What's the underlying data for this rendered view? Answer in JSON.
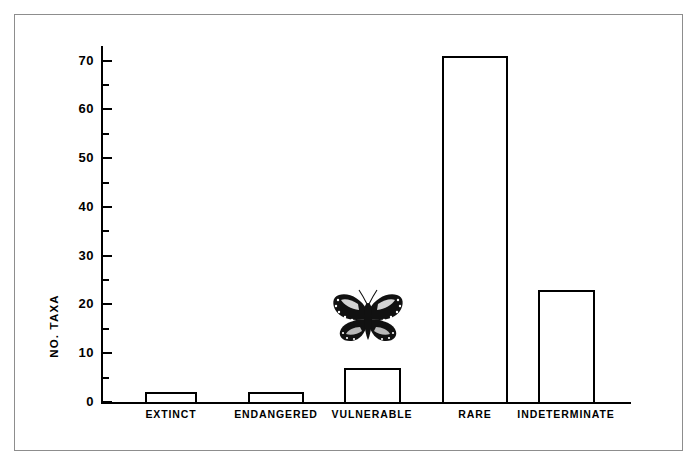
{
  "figure": {
    "border_color": "#8d8d8d",
    "background": "#ffffff",
    "ink_color": "#000000"
  },
  "chart_data": {
    "type": "bar",
    "title": "",
    "xlabel": "",
    "ylabel": "NO. TAXA",
    "categories": [
      "EXTINCT",
      "ENDANGERED",
      "VULNERABLE",
      "RARE",
      "INDETERMINATE"
    ],
    "values": [
      2,
      2,
      7,
      71,
      23
    ],
    "ylim": [
      0,
      73
    ],
    "y_major_ticks": [
      0,
      10,
      20,
      30,
      40,
      50,
      60,
      70
    ],
    "y_minor_ticks": [
      5,
      15,
      25,
      35,
      45,
      55,
      65
    ],
    "y_tick_labels": [
      "0",
      "10",
      "20",
      "30",
      "40",
      "50",
      "60",
      "70"
    ],
    "grid": false,
    "legend": false,
    "bar_style": "outlined-unfilled",
    "bar_edge_color": "#000000",
    "bar_fill_color": "#ffffff"
  },
  "annotations": {
    "butterfly": {
      "icon": "butterfly-illustration",
      "above_category": "VULNERABLE",
      "description": "Black and white engraving of a butterfly with spread wings"
    }
  }
}
